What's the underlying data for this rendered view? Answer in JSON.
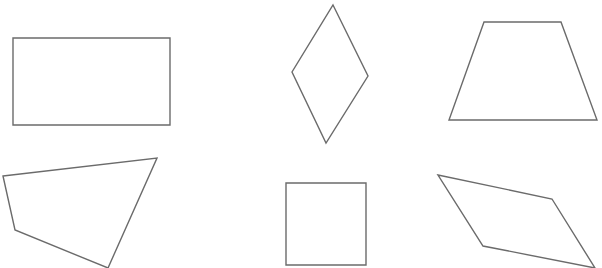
{
  "diagram": {
    "background": "#ffffff",
    "stroke_color": "#6b6b6b",
    "shapes": [
      {
        "name": "rectangle",
        "points": "13,38 170,38 170,125 13,125"
      },
      {
        "name": "rhombus",
        "points": "333,5 368,76 326,143 292,72"
      },
      {
        "name": "trapezoid",
        "points": "484,22 561,22 597,120 449,120"
      },
      {
        "name": "irregular-quadrilateral",
        "points": "3,176 157,158 108,268 15,230"
      },
      {
        "name": "square",
        "points": "286,183 366,183 366,265 286,265"
      },
      {
        "name": "parallelogram",
        "points": "438,175 552,199 595,268 483,246"
      }
    ]
  }
}
